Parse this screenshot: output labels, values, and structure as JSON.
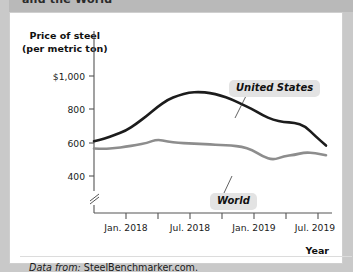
{
  "figure": {
    "title_partial": "and the World",
    "source_prefix": "Data from:",
    "source_name": "SteelBenchmarker.com."
  },
  "chart_data": {
    "type": "line",
    "title": "and the World",
    "ylabel_line1": "Price of steel",
    "ylabel_line2": "(per metric ton)",
    "xlabel": "Year",
    "ylim": [
      340,
      1060
    ],
    "yticks": [
      400,
      600,
      800,
      1000
    ],
    "ytick_labels": [
      "400",
      "600",
      "800",
      "$1,000"
    ],
    "y_axis_break": true,
    "grid": false,
    "legend_position": "inline-annotations",
    "xtick_labels": [
      "Jan. 2018",
      "Jul. 2018",
      "Jan. 2019",
      "Jul. 2019"
    ],
    "x": [
      "2017-10",
      "2017-11",
      "2017-12",
      "2018-01",
      "2018-02",
      "2018-03",
      "2018-04",
      "2018-05",
      "2018-06",
      "2018-07",
      "2018-08",
      "2018-09",
      "2018-10",
      "2018-11",
      "2018-12",
      "2019-01",
      "2019-02",
      "2019-03",
      "2019-04",
      "2019-05",
      "2019-06",
      "2019-07",
      "2019-08"
    ],
    "series": [
      {
        "name": "United States",
        "color": "#1c1c1c",
        "values": [
          610,
          625,
          648,
          672,
          712,
          760,
          812,
          855,
          880,
          897,
          900,
          895,
          880,
          858,
          828,
          800,
          762,
          736,
          723,
          720,
          700,
          640,
          585
        ]
      },
      {
        "name": "World",
        "color": "#8d8d8d",
        "values": [
          568,
          565,
          570,
          578,
          588,
          600,
          622,
          608,
          600,
          598,
          595,
          592,
          588,
          585,
          578,
          560,
          520,
          500,
          522,
          530,
          545,
          540,
          528
        ]
      }
    ],
    "annotations": [
      {
        "label": "United States",
        "target_series": "United States"
      },
      {
        "label": "World",
        "target_series": "World"
      }
    ]
  }
}
